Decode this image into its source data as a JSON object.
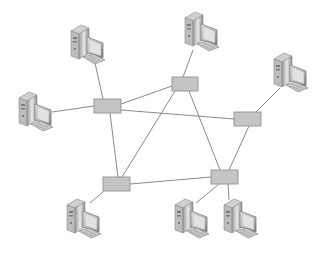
{
  "diagram": {
    "type": "network-topology",
    "background": "#ffffff",
    "colors": {
      "edge": "#8a8a8a",
      "hub_fill": "#c4c4c4",
      "hub_stroke": "#9a9a9a",
      "computer_light": "#e6e6e6",
      "computer_mid": "#b8b8b8",
      "computer_dark": "#7a7a7a"
    },
    "hubs": [
      {
        "id": "hub1",
        "x": 94,
        "y": 99,
        "w": 27,
        "h": 14
      },
      {
        "id": "hub2",
        "x": 172,
        "y": 77,
        "w": 26,
        "h": 14
      },
      {
        "id": "hub3",
        "x": 234,
        "y": 112,
        "w": 27,
        "h": 14
      },
      {
        "id": "hub4",
        "x": 103,
        "y": 177,
        "w": 27,
        "h": 14
      },
      {
        "id": "hub5",
        "x": 211,
        "y": 170,
        "w": 27,
        "h": 14
      }
    ],
    "computers": [
      {
        "id": "pc1",
        "x": 69,
        "y": 25
      },
      {
        "id": "pc2",
        "x": 17,
        "y": 92
      },
      {
        "id": "pc3",
        "x": 183,
        "y": 12
      },
      {
        "id": "pc4",
        "x": 272,
        "y": 53
      },
      {
        "id": "pc5",
        "x": 65,
        "y": 199
      },
      {
        "id": "pc6",
        "x": 173,
        "y": 199
      },
      {
        "id": "pc7",
        "x": 222,
        "y": 199
      }
    ],
    "edges": [
      {
        "from": "pc1",
        "to": "hub1",
        "x1": 95,
        "y1": 63,
        "x2": 103,
        "y2": 99
      },
      {
        "from": "pc2",
        "to": "hub1",
        "x1": 52,
        "y1": 112,
        "x2": 94,
        "y2": 106
      },
      {
        "from": "pc3",
        "to": "hub2",
        "x1": 193,
        "y1": 50,
        "x2": 183,
        "y2": 77
      },
      {
        "from": "pc4",
        "to": "hub3",
        "x1": 280,
        "y1": 88,
        "x2": 256,
        "y2": 112
      },
      {
        "from": "pc5",
        "to": "hub4",
        "x1": 90,
        "y1": 203,
        "x2": 104,
        "y2": 191
      },
      {
        "from": "pc6",
        "to": "hub5",
        "x1": 196,
        "y1": 203,
        "x2": 219,
        "y2": 184
      },
      {
        "from": "pc7",
        "to": "hub5",
        "x1": 229,
        "y1": 200,
        "x2": 228,
        "y2": 184
      },
      {
        "from": "hub1",
        "to": "hub2",
        "x1": 121,
        "y1": 104,
        "x2": 172,
        "y2": 86
      },
      {
        "from": "hub1",
        "to": "hub3",
        "x1": 121,
        "y1": 110,
        "x2": 234,
        "y2": 119
      },
      {
        "from": "hub1",
        "to": "hub4",
        "x1": 110,
        "y1": 113,
        "x2": 118,
        "y2": 177
      },
      {
        "from": "hub2",
        "to": "hub4",
        "x1": 175,
        "y1": 91,
        "x2": 122,
        "y2": 177
      },
      {
        "from": "hub2",
        "to": "hub5",
        "x1": 189,
        "y1": 91,
        "x2": 220,
        "y2": 170
      },
      {
        "from": "hub3",
        "to": "hub5",
        "x1": 249,
        "y1": 126,
        "x2": 229,
        "y2": 170
      },
      {
        "from": "hub4",
        "to": "hub5",
        "x1": 130,
        "y1": 184,
        "x2": 211,
        "y2": 177
      }
    ]
  }
}
